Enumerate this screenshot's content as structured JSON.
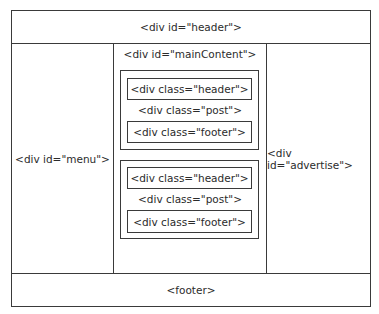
{
  "diagram": {
    "header": {
      "label": "<div id=\"header\">"
    },
    "menu": {
      "label": "<div id=\"menu\">"
    },
    "main_content": {
      "label": "<div id=\"mainContent\">",
      "posts": [
        {
          "header_label": "<div class=\"header\">",
          "post_label": "<div class=\"post\">",
          "footer_label": "<div class=\"footer\">"
        },
        {
          "header_label": "<div class=\"header\">",
          "post_label": "<div class=\"post\">",
          "footer_label": "<div class=\"footer\">"
        }
      ]
    },
    "advertise": {
      "label": "<div id=\"advertise\">"
    },
    "footer": {
      "label": "<footer>"
    }
  }
}
